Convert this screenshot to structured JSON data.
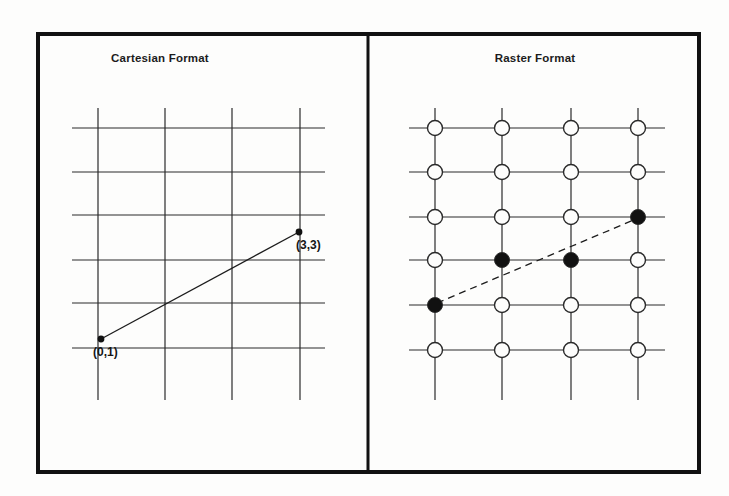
{
  "figure": {
    "background_color": "#fdfdfc",
    "ink_color": "#1c1c1c",
    "border_color": "#111111",
    "frame": {
      "x": 38,
      "y": 34,
      "width": 661,
      "height": 438,
      "stroke_width": 4
    },
    "divider": {
      "x": 368,
      "y_top": 34,
      "y_bottom": 472,
      "stroke_width": 3
    }
  },
  "panels": {
    "cartesian": {
      "title": "Cartesian Format",
      "title_center_x": 160,
      "title_y": 52,
      "grid": {
        "vertical_x": [
          98,
          165,
          232,
          300
        ],
        "horizontal_y": [
          128,
          172,
          215,
          260,
          303,
          348
        ],
        "v_extent": [
          108,
          400
        ],
        "h_extent": [
          72,
          325
        ],
        "stroke_width": 1.2
      },
      "vector_line": {
        "from": {
          "label": "(0,1)",
          "x": 101,
          "y": 339
        },
        "to": {
          "label": "(3,3)",
          "x": 299,
          "y": 232
        },
        "style": "solid",
        "stroke_width": 1.3
      },
      "points": [
        {
          "label": "(0,1)",
          "x": 101,
          "y": 339,
          "label_x": 93,
          "label_y": 345,
          "radius": 3.4,
          "fill": "filled"
        },
        {
          "label": "(3,3)",
          "x": 299,
          "y": 232,
          "label_x": 296,
          "label_y": 238,
          "radius": 3.4,
          "fill": "filled"
        }
      ]
    },
    "raster": {
      "title": "Raster Format",
      "title_center_x": 535,
      "title_y": 52,
      "grid": {
        "vertical_x": [
          435,
          502,
          571,
          638
        ],
        "horizontal_y": [
          128,
          172,
          217,
          260,
          305,
          350
        ],
        "v_extent": [
          108,
          400
        ],
        "h_extent": [
          409,
          665
        ],
        "stroke_width": 1.2
      },
      "cell_radius": 7.5,
      "columns": 4,
      "rows": 6,
      "cells": [
        {
          "row": 0,
          "col": 0,
          "state": "empty"
        },
        {
          "row": 0,
          "col": 1,
          "state": "empty"
        },
        {
          "row": 0,
          "col": 2,
          "state": "empty"
        },
        {
          "row": 0,
          "col": 3,
          "state": "empty"
        },
        {
          "row": 1,
          "col": 0,
          "state": "empty"
        },
        {
          "row": 1,
          "col": 1,
          "state": "empty"
        },
        {
          "row": 1,
          "col": 2,
          "state": "empty"
        },
        {
          "row": 1,
          "col": 3,
          "state": "empty"
        },
        {
          "row": 2,
          "col": 0,
          "state": "empty"
        },
        {
          "row": 2,
          "col": 1,
          "state": "empty"
        },
        {
          "row": 2,
          "col": 2,
          "state": "empty"
        },
        {
          "row": 2,
          "col": 3,
          "state": "filled"
        },
        {
          "row": 3,
          "col": 0,
          "state": "empty"
        },
        {
          "row": 3,
          "col": 1,
          "state": "filled"
        },
        {
          "row": 3,
          "col": 2,
          "state": "filled"
        },
        {
          "row": 3,
          "col": 3,
          "state": "empty"
        },
        {
          "row": 4,
          "col": 0,
          "state": "filled"
        },
        {
          "row": 4,
          "col": 1,
          "state": "empty"
        },
        {
          "row": 4,
          "col": 2,
          "state": "empty"
        },
        {
          "row": 4,
          "col": 3,
          "state": "empty"
        },
        {
          "row": 5,
          "col": 0,
          "state": "empty"
        },
        {
          "row": 5,
          "col": 1,
          "state": "empty"
        },
        {
          "row": 5,
          "col": 2,
          "state": "empty"
        },
        {
          "row": 5,
          "col": 3,
          "state": "empty"
        }
      ],
      "dashed_line": {
        "from": {
          "x": 437,
          "y": 303
        },
        "to": {
          "x": 636,
          "y": 219
        },
        "style": "dashed",
        "dash_pattern": "7 5",
        "stroke_width": 1.3
      }
    }
  },
  "chart_data": {
    "type": "diagram",
    "panels": [
      {
        "name": "Cartesian Format",
        "grid_columns": 4,
        "grid_rows": 6,
        "feature": "line segment",
        "endpoints": [
          {
            "label": "(0,1)",
            "x": 0,
            "y": 1
          },
          {
            "label": "(3,3)",
            "x": 3,
            "y": 3
          }
        ],
        "line_style": "solid"
      },
      {
        "name": "Raster Format",
        "grid_columns": 4,
        "grid_rows": 6,
        "feature": "rasterized line cells",
        "filled_cells": [
          {
            "col": 0,
            "row": 4
          },
          {
            "col": 1,
            "row": 3
          },
          {
            "col": 2,
            "row": 3
          },
          {
            "col": 3,
            "row": 2
          }
        ],
        "reference_line_style": "dashed"
      }
    ]
  }
}
